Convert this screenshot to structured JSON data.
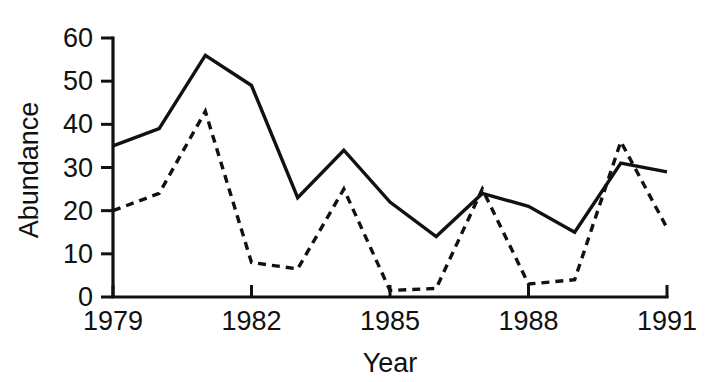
{
  "chart_data": {
    "type": "line",
    "title": "",
    "xlabel": "Year",
    "ylabel": "Abundance",
    "x": [
      1979,
      1980,
      1981,
      1982,
      1983,
      1984,
      1985,
      1986,
      1987,
      1988,
      1989,
      1990,
      1991
    ],
    "xlim": [
      1979,
      1991
    ],
    "ylim": [
      0,
      60
    ],
    "grid": false,
    "legend": "none",
    "xticks": [
      1979,
      1982,
      1985,
      1988,
      1991
    ],
    "xtick_labels": [
      "1979",
      "1982",
      "1985",
      "1988",
      "1991"
    ],
    "yticks": [
      0,
      10,
      20,
      30,
      40,
      50,
      60
    ],
    "ytick_labels": [
      "0",
      "10",
      "20",
      "30",
      "40",
      "50",
      "60"
    ],
    "series": [
      {
        "name": "solid-series",
        "style": "solid",
        "color": "#111111",
        "values": [
          35,
          39,
          56,
          49,
          23,
          34,
          22,
          14,
          24,
          21,
          15,
          31,
          29
        ]
      },
      {
        "name": "dashed-series",
        "style": "dashed",
        "color": "#111111",
        "values": [
          20,
          24,
          43,
          8,
          6.5,
          25,
          1.5,
          2,
          25,
          3,
          4,
          36,
          16
        ]
      }
    ]
  },
  "axis_titles": {
    "x": "Year",
    "y": "Abundance"
  }
}
